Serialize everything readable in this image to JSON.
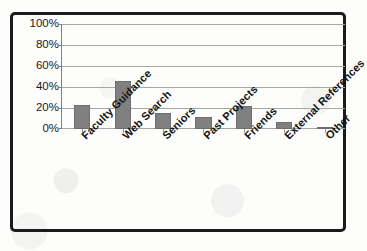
{
  "chart_data": {
    "type": "bar",
    "title": "",
    "subtitle": "",
    "xlabel": "",
    "ylabel": "",
    "categories": [
      "Faculty Guidance",
      "Web Search",
      "Seniors",
      "Past Projects",
      "Friends",
      "External References",
      "Other"
    ],
    "values": [
      23,
      46,
      15,
      11,
      22,
      7,
      1
    ],
    "value_labels": [
      "23%",
      "46%",
      "15%",
      "11%",
      "22%",
      "7%",
      "1%"
    ],
    "ylim": [
      0,
      100
    ],
    "y_ticks": [
      0,
      20,
      40,
      60,
      80,
      100
    ],
    "y_tick_labels": [
      "0%",
      "20%",
      "40%",
      "60%",
      "80%",
      "100%"
    ],
    "grid": true,
    "legend": false,
    "legend_position": "none",
    "series": [
      {
        "name": "Percentage of respondents",
        "values": [
          23,
          46,
          15,
          11,
          22,
          7,
          1
        ]
      }
    ],
    "annotations": []
  },
  "style": {
    "bar_color": "#808080",
    "bar_border_color": "#6e6e6e",
    "gridline_color": "#a6a6a6",
    "axis_color": "#808080",
    "frame_color": "#1b1b1b",
    "text_color": "#1a1a1a",
    "background_color": "#fdfdfc"
  }
}
